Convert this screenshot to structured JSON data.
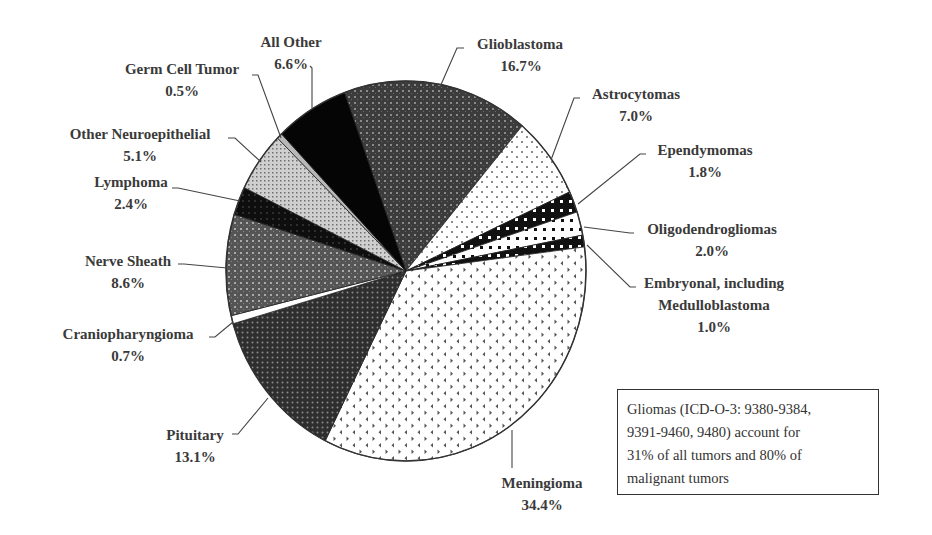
{
  "chart_data": {
    "type": "pie",
    "title": "",
    "unit": "%",
    "start_angle_deg": -110,
    "direction": "clockwise",
    "slices": [
      {
        "label": "Glioblastoma",
        "value": 16.7,
        "pattern": "dark-grid"
      },
      {
        "label": "Astrocytomas",
        "value": 7.0,
        "pattern": "sparse-dots"
      },
      {
        "label": "Ependymomas",
        "value": 1.8,
        "pattern": "black-white-squares"
      },
      {
        "label": "Oligodendrogliomas",
        "value": 2.0,
        "pattern": "white-black-squares"
      },
      {
        "label": "Embryonal, including Medulloblastoma",
        "value": 1.0,
        "pattern": "black-white-squares"
      },
      {
        "label": "Meningioma",
        "value": 34.4,
        "pattern": "chevrons"
      },
      {
        "label": "Pituitary",
        "value": 13.1,
        "pattern": "dark-mesh"
      },
      {
        "label": "Craniopharyngioma",
        "value": 0.7,
        "pattern": "white"
      },
      {
        "label": "Nerve Sheath",
        "value": 8.6,
        "pattern": "medium-grid"
      },
      {
        "label": "Lymphoma",
        "value": 2.4,
        "pattern": "black-dots"
      },
      {
        "label": "Other Neuroepithelial",
        "value": 5.1,
        "pattern": "light-grid"
      },
      {
        "label": "Germ Cell Tumor",
        "value": 0.5,
        "pattern": "light-gray"
      },
      {
        "label": "All Other",
        "value": 6.6,
        "pattern": "solid-black"
      }
    ],
    "annotation": "Gliomas (ICD-O-3: 9380-9384, 9391-9460, 9480) account for 31% of all tumors and 80% of malignant tumors",
    "legend": "none (direct labels with leader lines)"
  },
  "labels": {
    "glioblastoma": {
      "name": "Glioblastoma",
      "pct": "16.7%"
    },
    "astrocytomas": {
      "name": "Astrocytomas",
      "pct": "7.0%"
    },
    "ependymomas": {
      "name": "Ependymomas",
      "pct": "1.8%"
    },
    "oligodendrogliomas": {
      "name": "Oligodendrogliomas",
      "pct": "2.0%"
    },
    "embryonal": {
      "name1": "Embryonal, including",
      "name2": "Medulloblastoma",
      "pct": "1.0%"
    },
    "meningioma": {
      "name": "Meningioma",
      "pct": "34.4%"
    },
    "pituitary": {
      "name": "Pituitary",
      "pct": "13.1%"
    },
    "craniopharyngioma": {
      "name": "Craniopharyngioma",
      "pct": "0.7%"
    },
    "nerve_sheath": {
      "name": "Nerve Sheath",
      "pct": "8.6%"
    },
    "lymphoma": {
      "name": "Lymphoma",
      "pct": "2.4%"
    },
    "other_neuroepithelial": {
      "name": "Other Neuroepithelial",
      "pct": "5.1%"
    },
    "germ_cell": {
      "name": "Germ Cell Tumor",
      "pct": "0.5%"
    },
    "all_other": {
      "name": "All Other",
      "pct": "6.6%"
    }
  },
  "note": {
    "line1": "Gliomas (ICD-O-3: 9380-9384,",
    "line2": "9391-9460, 9480) account for",
    "line3": "31% of all tumors and 80% of",
    "line4": "malignant tumors"
  }
}
